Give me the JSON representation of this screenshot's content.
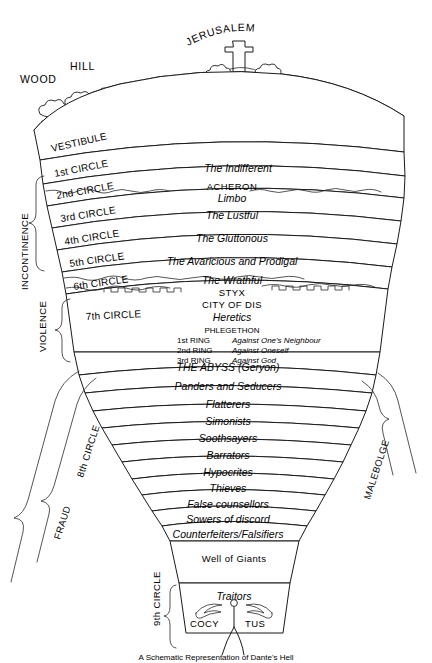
{
  "figure": {
    "title": "A Schematic Representation of Dante's Hell",
    "surface": {
      "jerusalem": "JERUSALEM",
      "hill": "HILL",
      "wood": "WOOD",
      "cross_icon": "cross-icon"
    },
    "side_brackets": {
      "left": [
        {
          "label": "INCONTINENCE"
        },
        {
          "label": "VIOLENCE"
        },
        {
          "label": "FRAUD"
        }
      ],
      "diagonal_left": "8th CIRCLE",
      "diagonal_right": "MALEBOLGE",
      "vertical_bottom": "9th CIRCLE"
    },
    "tiers": [
      {
        "circle": "VESTIBULE",
        "name": ""
      },
      {
        "circle": "1st CIRCLE",
        "name": "The Indifferent"
      },
      {
        "circle": "2nd CIRCLE",
        "name": "Limbo",
        "river": "ACHERON"
      },
      {
        "circle": "3rd CIRCLE",
        "name": "The Lustful"
      },
      {
        "circle": "4th CIRCLE",
        "name": "The Gluttonous"
      },
      {
        "circle": "5th CIRCLE",
        "name": "The Avaricious and Prodigal"
      },
      {
        "circle": "6th CIRCLE",
        "name": "The Wrathful",
        "river": "STYX",
        "wall": "CITY OF DIS"
      },
      {
        "circle": "7th CIRCLE",
        "name": "Heretics",
        "river": "PHLEGETHON"
      }
    ],
    "seventh_rings": [
      {
        "ring": "1st RING",
        "sin": "Against One's Neighbour"
      },
      {
        "ring": "2nd RING",
        "sin": "Against Oneself"
      },
      {
        "ring": "3rd RING",
        "sin": "Against God"
      }
    ],
    "abyss": "THE ABYSS (Geryon)",
    "malebolge": [
      "Panders and Seducers",
      "Flatterers",
      "Simonists",
      "Soothsayers",
      "Barrators",
      "Hypocrites",
      "Thieves",
      "False counsellors",
      "Sowers of discord",
      "Counterfeiters/Falsifiers"
    ],
    "well": "Well of Giants",
    "traitors": "Traitors",
    "cocytus_left": "COCY",
    "cocytus_right": "TUS",
    "satan_icon": "satan-figure-icon",
    "colors": {
      "ink": "#1a1a1a",
      "paper": "#ffffff"
    }
  }
}
